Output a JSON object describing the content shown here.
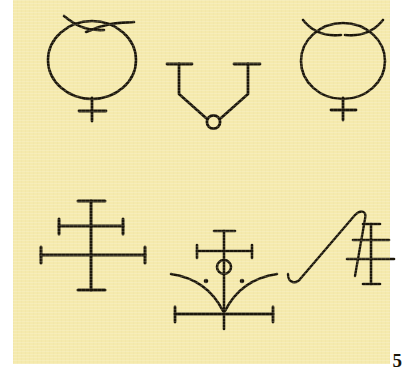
{
  "plate": {
    "number_label": "5",
    "background_color": "#f5eaad",
    "page_color": "#ffffff",
    "ink_color": "#1a1509",
    "width": 408,
    "height": 376
  },
  "symbols": [
    {
      "id": "symbol-1",
      "name": "circle-with-crossed-horns-and-cross",
      "row": 1,
      "column": 1,
      "description": "Circle topped by two crossing horn strokes, with a small cross below"
    },
    {
      "id": "symbol-2",
      "name": "v-shape-with-capped-arms-and-circle",
      "row": 1,
      "column": 2,
      "description": "V shape with horizontal end caps on both upper arms and a small open circle at the vertex"
    },
    {
      "id": "symbol-3",
      "name": "circle-with-horns-and-cross",
      "row": 1,
      "column": 3,
      "description": "Circle topped by two outward curving horns, with a small cross below"
    },
    {
      "id": "symbol-4",
      "name": "double-cross-serif",
      "row": 2,
      "column": 1,
      "description": "Vertical stem with serif caps crossed by a short upper bar and a long lower bar, each serif capped"
    },
    {
      "id": "symbol-5",
      "name": "cross-circle-arcs-with-dots",
      "row": 2,
      "column": 2,
      "description": "Serif cross above a small circle, flanked by two dots, with two downward sweeping arcs and a capped bottom bar"
    },
    {
      "id": "symbol-6",
      "name": "hooked-stroke-with-double-cross",
      "row": 2,
      "column": 3,
      "description": "Long diagonal stroke hooked at the lower left, paired with a serif double cross"
    }
  ]
}
